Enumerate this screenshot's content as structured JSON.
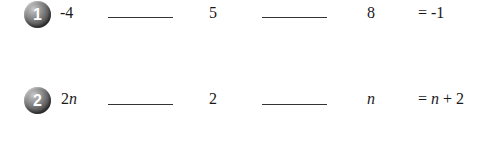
{
  "problems": [
    {
      "number": "1",
      "term1": "-4",
      "term2": "5",
      "term3": "8",
      "result": "= -1",
      "blank1": "",
      "blank2": ""
    },
    {
      "number": "2",
      "term1_coef": "2",
      "term1_var": "n",
      "term2": "2",
      "term3": "n",
      "result_eq": "= ",
      "result_var": "n",
      "result_rest": " + 2",
      "blank1": "",
      "blank2": ""
    }
  ],
  "colors": {
    "text": "#1a1a1a",
    "badge_dark": "#2a2a2a",
    "badge_light": "#c8c8c8",
    "blank_line": "#333333"
  }
}
